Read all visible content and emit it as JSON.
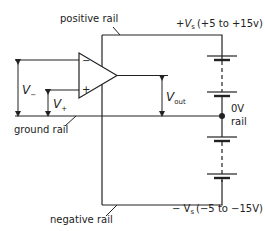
{
  "diagram": {
    "type": "op-amp power supply rails schematic",
    "labels": {
      "positive_rail": "positive rail",
      "ground_rail": "ground rail",
      "negative_rail": "negative rail",
      "zero_v": "0V",
      "zero_v_rail": "rail",
      "pos_supply_prefix": "+V",
      "pos_supply_sub": "s",
      "pos_supply_range": "(+5 to +15v)",
      "neg_supply_prefix": "− V",
      "neg_supply_sub": "s",
      "neg_supply_range": "(−5 to −15V)",
      "v_minus": "V",
      "v_minus_sub": "−",
      "v_plus": "V",
      "v_plus_sub": "+",
      "v_out": "V",
      "v_out_sub": "out",
      "inverting_input": "−",
      "noninverting_input": "+"
    },
    "colors": {
      "line": "#222222",
      "background": "#ffffff"
    }
  }
}
